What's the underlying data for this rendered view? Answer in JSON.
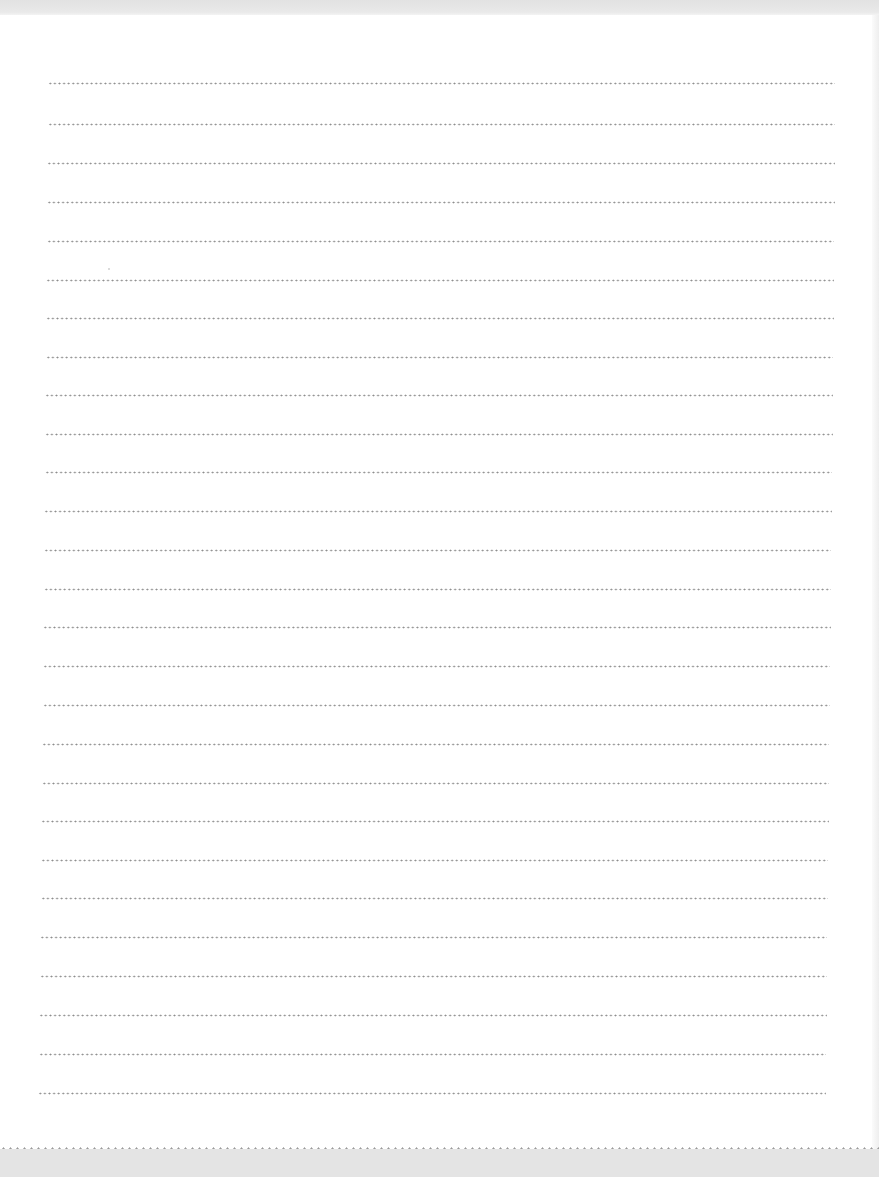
{
  "document": {
    "type": "blank dotted-line writing sheet",
    "line_count": 27,
    "colors": {
      "paper": "#ffffff",
      "dots": "#8c8c8c",
      "scan_border": "#e4e4e4"
    },
    "lines": [
      {
        "y": 83,
        "x1": 48,
        "x2": 835
      },
      {
        "y": 124,
        "x1": 48,
        "x2": 835
      },
      {
        "y": 163,
        "x1": 47,
        "x2": 835
      },
      {
        "y": 202,
        "x1": 47,
        "x2": 835
      },
      {
        "y": 241,
        "x1": 47,
        "x2": 834
      },
      {
        "y": 280,
        "x1": 46,
        "x2": 834
      },
      {
        "y": 318,
        "x1": 46,
        "x2": 834
      },
      {
        "y": 357,
        "x1": 46,
        "x2": 833
      },
      {
        "y": 395,
        "x1": 45,
        "x2": 833
      },
      {
        "y": 434,
        "x1": 45,
        "x2": 833
      },
      {
        "y": 472,
        "x1": 45,
        "x2": 832
      },
      {
        "y": 511,
        "x1": 44,
        "x2": 832
      },
      {
        "y": 550,
        "x1": 44,
        "x2": 831
      },
      {
        "y": 589,
        "x1": 44,
        "x2": 831
      },
      {
        "y": 627,
        "x1": 43,
        "x2": 831
      },
      {
        "y": 666,
        "x1": 43,
        "x2": 830
      },
      {
        "y": 705,
        "x1": 43,
        "x2": 830
      },
      {
        "y": 744,
        "x1": 42,
        "x2": 829
      },
      {
        "y": 783,
        "x1": 42,
        "x2": 829
      },
      {
        "y": 821,
        "x1": 41,
        "x2": 829
      },
      {
        "y": 860,
        "x1": 41,
        "x2": 828
      },
      {
        "y": 898,
        "x1": 41,
        "x2": 828
      },
      {
        "y": 937,
        "x1": 40,
        "x2": 827
      },
      {
        "y": 976,
        "x1": 40,
        "x2": 827
      },
      {
        "y": 1015,
        "x1": 39,
        "x2": 827
      },
      {
        "y": 1054,
        "x1": 39,
        "x2": 826
      },
      {
        "y": 1093,
        "x1": 38,
        "x2": 826
      }
    ]
  }
}
